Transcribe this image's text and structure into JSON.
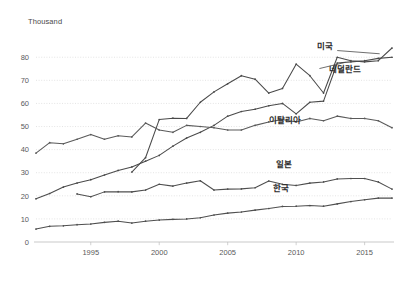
{
  "chart_data": {
    "type": "line",
    "title": "",
    "subtitle": "",
    "xlabel": "",
    "ylabel": "Thousand",
    "unit_label": "Thousand",
    "xlim": [
      1991,
      2017
    ],
    "ylim": [
      0,
      84
    ],
    "grid": true,
    "legend_position": "inline-labels",
    "ytick_labels": [
      "0",
      "10",
      "20",
      "30",
      "40",
      "50",
      "60",
      "70",
      "80"
    ],
    "ytick_values": [
      0,
      10,
      20,
      30,
      40,
      50,
      60,
      70,
      80
    ],
    "xtick_labels": [
      "1995",
      "2000",
      "2005",
      "2010",
      "2015"
    ],
    "xtick_values": [
      1995,
      2000,
      2005,
      2010,
      2015
    ],
    "x": [
      1991,
      1992,
      1993,
      1994,
      1995,
      1996,
      1997,
      1998,
      1999,
      2000,
      2001,
      2002,
      2003,
      2004,
      2005,
      2006,
      2007,
      2008,
      2009,
      2010,
      2011,
      2012,
      2013,
      2014,
      2015,
      2016,
      2017
    ],
    "series": [
      {
        "name": "미국",
        "label": "미국",
        "color": "#4a4a4a",
        "label_x": 2012.1,
        "label_y": 83.5,
        "values": [
          null,
          null,
          null,
          null,
          null,
          null,
          null,
          30.3,
          36.5,
          53.0,
          53.6,
          53.5,
          60.5,
          65.0,
          68.5,
          72.0,
          70.5,
          64.5,
          66.5,
          77.0,
          72.0,
          64.5,
          80.0,
          78.5,
          78.0,
          78.5,
          84.0
        ]
      },
      {
        "name": "네덜란드",
        "label": "네덜란드",
        "color": "#4a4a4a",
        "label_x": 2013.6,
        "label_y": 73.5,
        "values": [
          18.7,
          21.0,
          23.8,
          25.5,
          27.0,
          29.0,
          31.0,
          32.5,
          35.0,
          37.5,
          41.5,
          45.0,
          47.5,
          50.5,
          54.5,
          56.5,
          57.5,
          59.0,
          60.0,
          55.5,
          60.5,
          61.0,
          77.5,
          78.0,
          78.5,
          79.5,
          80.0
        ]
      },
      {
        "name": "이탈리아",
        "label": "이탈리아",
        "color": "#5a5a5a",
        "label_x": 2009.2,
        "label_y": 51.5,
        "values": [
          38.5,
          43.0,
          42.5,
          44.5,
          46.5,
          44.5,
          46.0,
          45.5,
          51.5,
          48.5,
          47.5,
          50.5,
          50.0,
          49.5,
          48.5,
          48.5,
          50.5,
          52.0,
          53.0,
          52.0,
          53.5,
          52.5,
          54.5,
          53.5,
          53.5,
          52.5,
          49.5
        ]
      },
      {
        "name": "일본",
        "label": "일본",
        "color": "#4f4f4f",
        "label_x": 2009.1,
        "label_y": 32.5,
        "values": [
          null,
          null,
          null,
          20.8,
          19.6,
          21.7,
          21.8,
          21.7,
          22.5,
          25.0,
          24.2,
          25.5,
          26.5,
          22.5,
          22.9,
          23.0,
          23.5,
          26.4,
          25.0,
          24.5,
          25.5,
          26.0,
          27.3,
          27.5,
          27.5,
          26.0,
          22.9
        ]
      },
      {
        "name": "한국",
        "label": "한국",
        "color": "#4f4f4f",
        "label_x": 2008.9,
        "label_y": 22.0,
        "values": [
          5.6,
          6.8,
          7.0,
          7.5,
          7.8,
          8.5,
          9.0,
          8.2,
          9.0,
          9.5,
          9.8,
          10.0,
          10.5,
          11.7,
          12.5,
          13.0,
          13.8,
          14.5,
          15.4,
          15.5,
          15.8,
          15.5,
          16.5,
          17.5,
          18.3,
          19.0,
          19.0
        ]
      }
    ]
  },
  "plot": {
    "left": 36,
    "right": 392,
    "top": 48,
    "bottom": 242
  }
}
